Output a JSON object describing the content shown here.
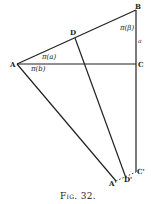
{
  "diagram": {
    "caption": "Fig. 32.",
    "points": {
      "A": {
        "label": "A",
        "x": 17,
        "y": 64
      },
      "B": {
        "label": "B",
        "x": 136,
        "y": 10
      },
      "C": {
        "label": "C",
        "x": 136,
        "y": 64
      },
      "D": {
        "label": "D",
        "x": 75,
        "y": 38
      },
      "A_prime": {
        "label": "A'",
        "x": 116,
        "y": 182
      },
      "D_prime": {
        "label": "D'",
        "x": 126,
        "y": 180
      },
      "C_prime": {
        "label": "C'",
        "x": 136,
        "y": 172
      }
    },
    "angle_labels": {
      "pi_beta": "π(β)",
      "pi_a": "π(a)",
      "pi_b": "π(b)",
      "side_a": "a"
    },
    "line_color": "#222222"
  }
}
